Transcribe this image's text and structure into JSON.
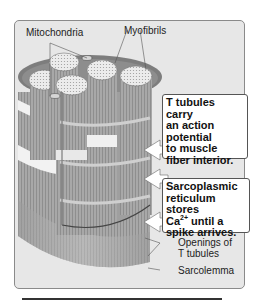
{
  "figure": {
    "labels": {
      "mitochondria": "Mitochondria",
      "myofibrils": "Myofibrils",
      "openings_line1": "Openings of",
      "openings_line2": "T tubules",
      "sarcolemma": "Sarcolemma"
    },
    "callouts": {
      "t_tubules": [
        "T tubules carry",
        "an action",
        "potential",
        "to muscle",
        "fiber interior."
      ],
      "sr": {
        "line1": "Sarcoplasmic",
        "line2": "reticulum stores",
        "line3_pre": "Ca",
        "line3_sup": "2+",
        "line3_post": " until a",
        "line4": "spike arrives."
      }
    },
    "colors": {
      "frame_bg": "#e7e7e7",
      "fiber": "#a9a9a9",
      "fiber_dark": "#7a7a7a",
      "band_light": "#f2f2f2",
      "callout_bg": "#ffffff"
    }
  }
}
